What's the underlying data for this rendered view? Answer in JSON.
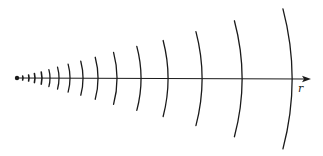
{
  "diagram": {
    "axis_label": "r",
    "stroke_color": "#1a1a1a",
    "source": {
      "x": 17,
      "y": 78,
      "radius": 2.2
    },
    "axis": {
      "x1": 17,
      "y1": 78,
      "x2": 311,
      "y2": 79
    },
    "wavefronts": [
      {
        "x": 23,
        "half_height": 2
      },
      {
        "x": 29,
        "half_height": 3
      },
      {
        "x": 35,
        "half_height": 4.5
      },
      {
        "x": 42,
        "half_height": 6
      },
      {
        "x": 50,
        "half_height": 8.5
      },
      {
        "x": 59,
        "half_height": 11
      },
      {
        "x": 70,
        "half_height": 14
      },
      {
        "x": 83,
        "half_height": 17
      },
      {
        "x": 98,
        "half_height": 21
      },
      {
        "x": 117,
        "half_height": 26
      },
      {
        "x": 141,
        "half_height": 32
      },
      {
        "x": 168,
        "half_height": 38
      },
      {
        "x": 202,
        "half_height": 47
      },
      {
        "x": 242,
        "half_height": 58
      },
      {
        "x": 292,
        "half_height": 70
      }
    ]
  }
}
